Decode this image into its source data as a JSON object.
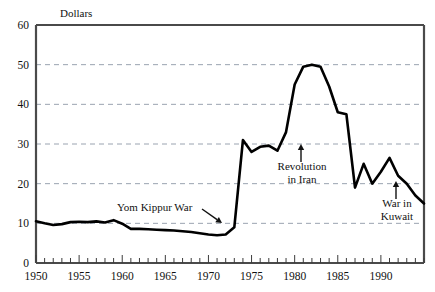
{
  "chart_data": {
    "type": "line",
    "title": "",
    "subtitle": "",
    "ylabel": "Dollars",
    "xlabel": "",
    "xlim": [
      1950,
      1995
    ],
    "ylim": [
      0,
      60
    ],
    "grid": "horizontal-dashed",
    "legend": "none",
    "y_ticks": [
      0,
      10,
      20,
      30,
      40,
      50,
      60
    ],
    "y_tick_labels": [
      "0",
      "10",
      "20",
      "30",
      "40",
      "50",
      "60"
    ],
    "x_ticks": [
      1950,
      1955,
      1960,
      1965,
      1970,
      1975,
      1980,
      1985,
      1990
    ],
    "x_tick_labels": [
      "1950",
      "1955",
      "1960",
      "1965",
      "1970",
      "1975",
      "1980",
      "1985",
      "1990"
    ],
    "x_minor_tick_interval": 1,
    "series": [
      {
        "name": "Crude oil price",
        "color": "#000000",
        "x": [
          1950,
          1951,
          1952,
          1953,
          1954,
          1955,
          1956,
          1957,
          1958,
          1959,
          1960,
          1961,
          1962,
          1963,
          1964,
          1965,
          1966,
          1967,
          1968,
          1969,
          1970,
          1971,
          1972,
          1973,
          1974,
          1975,
          1976,
          1977,
          1978,
          1979,
          1980,
          1981,
          1982,
          1983,
          1984,
          1985,
          1986,
          1987,
          1988,
          1989,
          1990,
          1991,
          1992,
          1993,
          1994,
          1995
        ],
        "values": [
          10.5,
          10.0,
          9.6,
          9.8,
          10.3,
          10.4,
          10.3,
          10.5,
          10.2,
          10.8,
          9.9,
          8.6,
          8.6,
          8.5,
          8.4,
          8.3,
          8.2,
          8.0,
          7.8,
          7.5,
          7.2,
          7.0,
          7.2,
          9.0,
          31.0,
          28.0,
          29.3,
          29.6,
          28.3,
          33.0,
          45.0,
          49.5,
          50.0,
          49.5,
          44.5,
          38.0,
          37.5,
          19.0,
          25.0,
          20.0,
          23.0,
          26.5,
          22.0,
          20.0,
          17.0,
          15.0
        ]
      }
    ],
    "annotations": [
      {
        "id": "yom-kippur-war",
        "text": "Yom Kippur War",
        "arrow": "diagonal-down-right",
        "points_to_year": 1973,
        "points_to_value": 9
      },
      {
        "id": "revolution-in-iran",
        "text_line1": "Revolution",
        "text_line2": "in Iran",
        "arrow": "up",
        "points_to_year": 1979,
        "points_to_value": 29
      },
      {
        "id": "war-in-kuwait",
        "text_line1": "War in",
        "text_line2": "Kuwait",
        "arrow": "up",
        "points_to_year": 1990,
        "points_to_value": 21
      }
    ],
    "colors": {
      "line": "#000000",
      "frame": "#4a4a4a",
      "grid": "#9aa3b0",
      "background": "#ffffff",
      "text": "#111111"
    }
  }
}
